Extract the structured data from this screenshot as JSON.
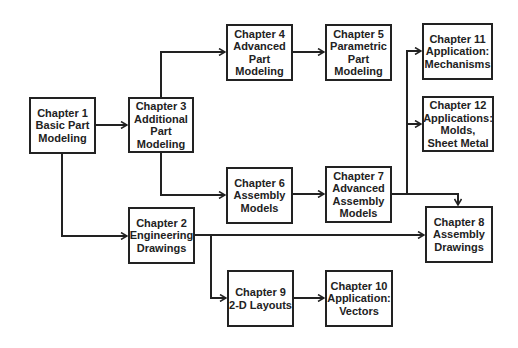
{
  "diagram": {
    "nodes": [
      {
        "id": "ch1",
        "lines": [
          "Chapter 1",
          "Basic Part",
          "Modeling"
        ]
      },
      {
        "id": "ch2",
        "lines": [
          "Chapter 2",
          "Engineering",
          "Drawings"
        ]
      },
      {
        "id": "ch3",
        "lines": [
          "Chapter 3",
          "Additional",
          "Part",
          "Modeling"
        ]
      },
      {
        "id": "ch4",
        "lines": [
          "Chapter 4",
          "Advanced",
          "Part",
          "Modeling"
        ]
      },
      {
        "id": "ch5",
        "lines": [
          "Chapter 5",
          "Parametric",
          "Part",
          "Modeling"
        ]
      },
      {
        "id": "ch6",
        "lines": [
          "Chapter 6",
          "Assembly",
          "Models"
        ]
      },
      {
        "id": "ch7",
        "lines": [
          "Chapter 7",
          "Advanced",
          "Assembly",
          "Models"
        ]
      },
      {
        "id": "ch8",
        "lines": [
          "Chapter 8",
          "Assembly",
          "Drawings"
        ]
      },
      {
        "id": "ch9",
        "lines": [
          "Chapter 9",
          "2-D Layouts"
        ]
      },
      {
        "id": "ch10",
        "lines": [
          "Chapter 10",
          "Application:",
          "Vectors"
        ]
      },
      {
        "id": "ch11",
        "lines": [
          "Chapter 11",
          "Application:",
          "Mechanisms"
        ]
      },
      {
        "id": "ch12",
        "lines": [
          "Chapter 12",
          "Applications:",
          "Molds,",
          "Sheet Metal"
        ]
      }
    ],
    "edges": [
      [
        "ch1",
        "ch3"
      ],
      [
        "ch1",
        "ch2"
      ],
      [
        "ch3",
        "ch4"
      ],
      [
        "ch3",
        "ch6"
      ],
      [
        "ch4",
        "ch5"
      ],
      [
        "ch6",
        "ch7"
      ],
      [
        "ch7",
        "ch11"
      ],
      [
        "ch7",
        "ch12"
      ],
      [
        "ch7",
        "ch8"
      ],
      [
        "ch2",
        "ch8"
      ],
      [
        "ch2",
        "ch9"
      ],
      [
        "ch9",
        "ch10"
      ]
    ]
  }
}
